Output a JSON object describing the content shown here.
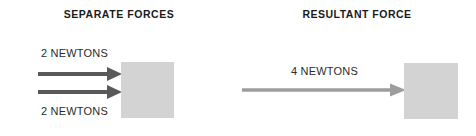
{
  "canvas": {
    "width": 476,
    "height": 136,
    "background": "#ffffff"
  },
  "colors": {
    "title_text": "#1a1a1a",
    "label_text": "#2b2b2b",
    "block_fill": "#d3d3d3",
    "separate_arrow": "#59595b",
    "resultant_arrow": "#9d9d9d"
  },
  "panels": {
    "left": {
      "title": "SEPARATE FORCES",
      "labels": {
        "top": "2 NEWTONS",
        "bottom": "2 NEWTONS"
      },
      "arrows": [
        {
          "name": "upper-force-arrow",
          "magnitude": "2 NEWTONS",
          "direction": "right",
          "color": "#59595b"
        },
        {
          "name": "lower-force-arrow",
          "magnitude": "2 NEWTONS",
          "direction": "right",
          "color": "#59595b"
        }
      ],
      "block": {
        "name": "object-block",
        "fill": "#d3d3d3"
      }
    },
    "right": {
      "title": "RESULTANT FORCE",
      "labels": {
        "main": "4 NEWTONS"
      },
      "arrows": [
        {
          "name": "resultant-force-arrow",
          "magnitude": "4 NEWTONS",
          "direction": "right",
          "color": "#9d9d9d"
        }
      ],
      "block": {
        "name": "object-block",
        "fill": "#d3d3d3"
      }
    }
  }
}
